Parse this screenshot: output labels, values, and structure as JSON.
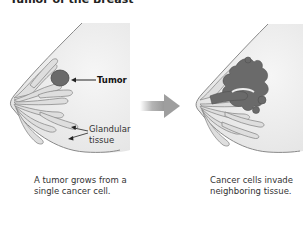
{
  "title": "Tumor of the Breast",
  "left_panel": {
    "labels": {
      "tumor": "Tumor",
      "glandular_line1": "Glandular",
      "glandular_line2": "tissue"
    },
    "caption_line1": "A tumor grows from a",
    "caption_line2": "single cancer cell."
  },
  "right_panel": {
    "caption_line1": "Cancer cells invade",
    "caption_line2": "neighboring tissue."
  },
  "arrow_icon": "right-arrow-icon",
  "colors": {
    "breast_fill": "#ececec",
    "outline": "#8a8a8a",
    "gland_fill": "#dcdcdc",
    "tumor": "#6a6a6a",
    "arrow": "#a8a8a8"
  }
}
